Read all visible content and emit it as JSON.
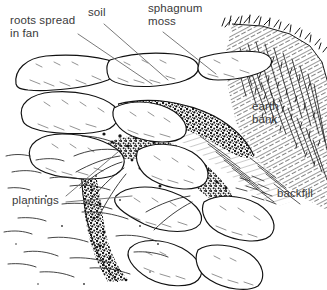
{
  "figure": {
    "type": "pen-and-ink technical illustration",
    "background_color": "#ffffff",
    "ink_color": "#1a1a1a",
    "label_color": "#3a3a3a",
    "width": 327,
    "height": 290
  },
  "labels": [
    {
      "id": "roots",
      "text": "roots spread\nin fan",
      "x": 10,
      "y": 14,
      "has_leader": true
    },
    {
      "id": "soil",
      "text": "soil",
      "x": 88,
      "y": 6,
      "has_leader": true
    },
    {
      "id": "sphagnum",
      "text": "sphagnum\nmoss",
      "x": 148,
      "y": 2,
      "has_leader": true
    },
    {
      "id": "earth",
      "text": "earth\nbank",
      "x": 252,
      "y": 100,
      "has_leader": false
    },
    {
      "id": "backfill",
      "text": "backfill",
      "x": 277,
      "y": 187,
      "has_leader": false
    },
    {
      "id": "plantings",
      "text": "plantings",
      "x": 12,
      "y": 194,
      "has_leader": true
    }
  ],
  "leader_lines": [
    {
      "for": "roots",
      "x1": 78,
      "y1": 34,
      "x2": 152,
      "y2": 84
    },
    {
      "for": "soil",
      "x1": 104,
      "y1": 24,
      "x2": 168,
      "y2": 80
    },
    {
      "for": "sphagnum",
      "x1": 163,
      "y1": 32,
      "x2": 216,
      "y2": 74
    },
    {
      "for": "plantings",
      "x1": 66,
      "y1": 196,
      "x2": 118,
      "y2": 152
    },
    {
      "for": "plantings",
      "x1": 66,
      "y1": 202,
      "x2": 132,
      "y2": 196
    }
  ],
  "scene_elements": [
    "stacked logs forming terraced chevron revetment",
    "dark stippled soil and root mass between log tiers",
    "grassy earth bank with hatching on upper right",
    "grass tufts along bank crest",
    "sparse horizontal dashes indicating flat ground foreground",
    "backfill hatching behind logs on right"
  ]
}
